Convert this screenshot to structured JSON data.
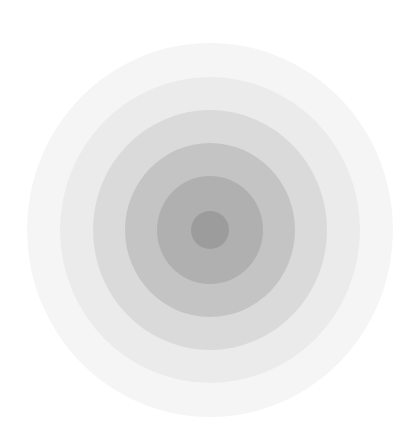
{
  "canvas": {
    "width": 413,
    "height": 439,
    "background": "#ffffff"
  },
  "target": {
    "center": {
      "x": 209.5,
      "y": 230
    },
    "rings": [
      {
        "name": "ring-1-outermost",
        "rx": 183,
        "ry": 187,
        "color": "#f5f5f5"
      },
      {
        "name": "ring-2",
        "rx": 150,
        "ry": 153,
        "color": "#ebebeb"
      },
      {
        "name": "ring-3",
        "rx": 117,
        "ry": 120,
        "color": "#dadada"
      },
      {
        "name": "ring-4",
        "rx": 85,
        "ry": 87,
        "color": "#c4c4c4"
      },
      {
        "name": "ring-5",
        "rx": 53,
        "ry": 54,
        "color": "#b0b0b0"
      },
      {
        "name": "ring-6-center",
        "rx": 19,
        "ry": 19,
        "color": "#9c9c9c"
      }
    ]
  }
}
